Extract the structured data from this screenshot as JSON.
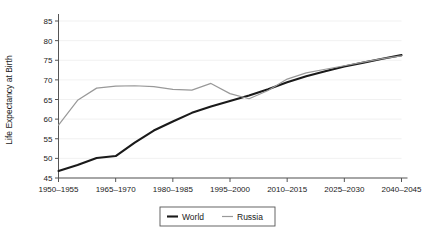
{
  "chart_data": {
    "type": "line",
    "title": "",
    "xlabel": "",
    "ylabel": "Life Expectancy at Birth",
    "ylim": [
      45,
      85
    ],
    "ytick_labels": [
      "45",
      "50",
      "55",
      "60",
      "65",
      "70",
      "75",
      "80",
      "85"
    ],
    "yticks": [
      45,
      50,
      55,
      60,
      65,
      70,
      75,
      80,
      85
    ],
    "grid": true,
    "legend_position": "bottom-center",
    "x": [
      "1950-1955",
      "1955-1960",
      "1960-1965",
      "1965-1970",
      "1970-1975",
      "1975-1980",
      "1980-1985",
      "1985-1990",
      "1990-1995",
      "1995-2000",
      "2000-2005",
      "2005-2010",
      "2010-2015",
      "2015-2020",
      "2020-2025",
      "2025-2030",
      "2030-2035",
      "2035-2040",
      "2040-2045"
    ],
    "xtick_labels": [
      "1950–1955",
      "1965–1970",
      "1980–1985",
      "1995–2000",
      "2010–2015",
      "2025–2030",
      "2040–2045"
    ],
    "xtick_indices": [
      0,
      3,
      6,
      9,
      12,
      15,
      18
    ],
    "series": [
      {
        "name": "World",
        "color": "#1a1a1a",
        "width": 2.1,
        "values": [
          46.8,
          48.3,
          50.1,
          50.6,
          54.0,
          57.1,
          59.4,
          61.6,
          63.2,
          64.6,
          66.0,
          67.6,
          69.4,
          70.9,
          72.2,
          73.4,
          74.4,
          75.4,
          76.3
        ]
      },
      {
        "name": "Russia",
        "color": "#999999",
        "width": 1.2,
        "values": [
          58.5,
          64.8,
          67.9,
          68.4,
          68.5,
          68.3,
          67.6,
          67.4,
          69.1,
          66.5,
          65.2,
          67.3,
          70.2,
          71.8,
          72.7,
          73.6,
          74.5,
          75.4,
          76.1
        ]
      }
    ]
  },
  "legend": {
    "entries": [
      {
        "label": "World",
        "marker": "line-black"
      },
      {
        "label": "Russia",
        "marker": "line-gray"
      }
    ]
  }
}
